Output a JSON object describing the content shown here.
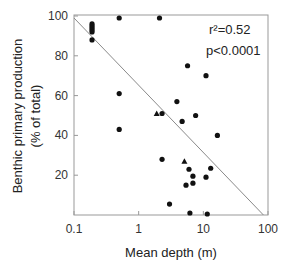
{
  "chart_data": {
    "type": "scatter",
    "title": "",
    "xlabel": "Mean depth (m)",
    "ylabel": "Benthic primary production",
    "ylabel_line2": "(% of total)",
    "xscale": "log",
    "xlim": [
      0.1,
      100
    ],
    "ylim": [
      0,
      100
    ],
    "xticks": [
      0.1,
      1,
      10,
      100
    ],
    "xtick_labels": [
      "0.1",
      "1",
      "10",
      "100"
    ],
    "yticks": [
      20,
      40,
      60,
      80,
      100
    ],
    "ytick_labels": [
      "20",
      "40",
      "60",
      "80",
      "100"
    ],
    "grid": false,
    "legend": null,
    "annotations": {
      "r2": "r²=0.52",
      "p": "p<0.0001"
    },
    "series": [
      {
        "name": "circles",
        "marker": "circle",
        "points": [
          {
            "x": 0.19,
            "y": 96
          },
          {
            "x": 0.19,
            "y": 95
          },
          {
            "x": 0.19,
            "y": 94
          },
          {
            "x": 0.19,
            "y": 93
          },
          {
            "x": 0.19,
            "y": 92
          },
          {
            "x": 0.19,
            "y": 88
          },
          {
            "x": 0.5,
            "y": 99
          },
          {
            "x": 0.5,
            "y": 61
          },
          {
            "x": 0.5,
            "y": 43
          },
          {
            "x": 2.1,
            "y": 99
          },
          {
            "x": 5.7,
            "y": 75
          },
          {
            "x": 11,
            "y": 70
          },
          {
            "x": 3.9,
            "y": 57
          },
          {
            "x": 2.3,
            "y": 51
          },
          {
            "x": 4.7,
            "y": 47
          },
          {
            "x": 7.6,
            "y": 50
          },
          {
            "x": 16.5,
            "y": 40
          },
          {
            "x": 2.3,
            "y": 28
          },
          {
            "x": 6.0,
            "y": 23
          },
          {
            "x": 13,
            "y": 23.5
          },
          {
            "x": 6.9,
            "y": 19.5
          },
          {
            "x": 11,
            "y": 19
          },
          {
            "x": 5.4,
            "y": 15
          },
          {
            "x": 6.9,
            "y": 16
          },
          {
            "x": 3.0,
            "y": 5.5
          },
          {
            "x": 6.2,
            "y": 1
          },
          {
            "x": 11.5,
            "y": 0.5
          }
        ]
      },
      {
        "name": "triangles",
        "marker": "triangle",
        "points": [
          {
            "x": 1.9,
            "y": 51
          },
          {
            "x": 5.1,
            "y": 27
          }
        ]
      }
    ],
    "regression_line": {
      "x": [
        0.1,
        85
      ],
      "y": [
        99,
        0
      ]
    }
  },
  "colors": {
    "marker": "#111111",
    "axis": "#999999",
    "line": "#8a8a8a",
    "text": "#222222"
  }
}
